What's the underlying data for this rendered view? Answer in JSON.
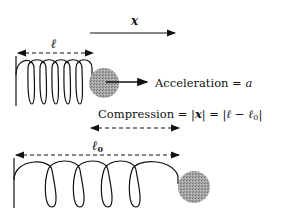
{
  "diagram": {
    "displacement_label": "x",
    "top_spring": {
      "length_label": "ℓ",
      "acceleration_text": "Acceleration = ",
      "acceleration_symbol": "a"
    },
    "compression": {
      "text_prefix": "Compression = |",
      "x_symbol": "x",
      "text_mid": "| = |",
      "l_symbol": "ℓ",
      "minus": " − ",
      "l0_symbol": "ℓ",
      "l0_sub": "0",
      "text_end": "|"
    },
    "bottom_spring": {
      "length_label": "ℓ",
      "length_sub": "0"
    },
    "colors": {
      "ink": "#111111",
      "ball": "#9a9a9a"
    }
  }
}
